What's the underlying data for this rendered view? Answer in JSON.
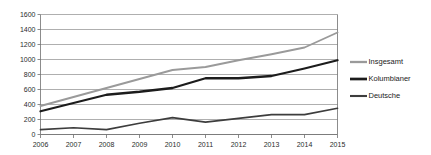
{
  "chart_data": {
    "type": "line",
    "title": "",
    "subtitle": "",
    "xlabel": "",
    "ylabel": "",
    "categories": [
      "2006",
      "2007",
      "2008",
      "2009",
      "2010",
      "2011",
      "2012",
      "2013",
      "2014",
      "2015"
    ],
    "x": [
      2006,
      2007,
      2008,
      2009,
      2010,
      2011,
      2012,
      2013,
      2014,
      2015
    ],
    "ylim": [
      0,
      1600
    ],
    "ytick_values": [
      0,
      200,
      400,
      600,
      800,
      1000,
      1200,
      1400,
      1600
    ],
    "ytick_labels": [
      "0",
      "200",
      "400",
      "600",
      "800",
      "1000",
      "1200",
      "1400",
      "1600"
    ],
    "grid": true,
    "grid_axis": "y",
    "legend_position": "right",
    "series": [
      {
        "name": "Insgesamt",
        "color": "#9a9a9a",
        "width": 1.9,
        "values": [
          380,
          500,
          620,
          740,
          860,
          900,
          990,
          1070,
          1160,
          1360
        ]
      },
      {
        "name": "Kolumbianer",
        "color": "#1c1c1c",
        "width": 2.3,
        "values": [
          310,
          420,
          530,
          570,
          620,
          750,
          750,
          780,
          880,
          990
        ]
      },
      {
        "name": "Deutsche",
        "color": "#3d3d3d",
        "width": 1.7,
        "values": [
          65,
          90,
          65,
          150,
          225,
          165,
          215,
          265,
          265,
          350
        ]
      }
    ]
  },
  "legend": {
    "entries": [
      {
        "label": "Insgesamt"
      },
      {
        "label": "Kolumbianer"
      },
      {
        "label": "Deutsche"
      }
    ]
  },
  "colors": {
    "background": "#ffffff",
    "gridline": "#8c8c8c",
    "axis": "#6f6f6f",
    "text": "#1a1a1a"
  }
}
